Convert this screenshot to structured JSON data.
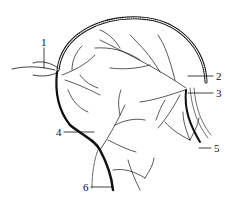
{
  "diagram": {
    "type": "anatomical vascular tree illustration",
    "colors": {
      "line": "#111111",
      "background": "#ffffff"
    },
    "labels": [
      {
        "id": "1",
        "text": "1",
        "x": 41,
        "y": 46
      },
      {
        "id": "2",
        "text": "2",
        "x": 218,
        "y": 78
      },
      {
        "id": "3",
        "text": "3",
        "x": 218,
        "y": 96
      },
      {
        "id": "4",
        "text": "4",
        "x": 58,
        "y": 135
      },
      {
        "id": "5",
        "text": "5",
        "x": 216,
        "y": 152
      },
      {
        "id": "6",
        "text": "6",
        "x": 84,
        "y": 190
      }
    ]
  }
}
